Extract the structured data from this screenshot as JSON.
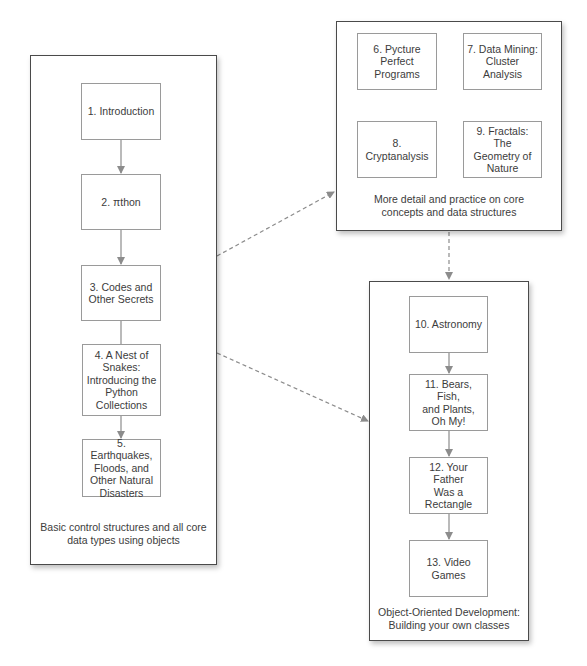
{
  "colors": {
    "group_border": "#4a4a4a",
    "node_border": "#9a9a9a",
    "arrow": "#8c8c8c",
    "text": "#3c3c3c",
    "background": "#ffffff"
  },
  "groups": [
    {
      "id": "basics",
      "caption": "Basic control structures and all core\ndata types using objects",
      "nodes": [
        {
          "id": "ch1",
          "label": "1. Introduction"
        },
        {
          "id": "ch2",
          "label": "2. πthon"
        },
        {
          "id": "ch3",
          "label": "3. Codes and\nOther Secrets"
        },
        {
          "id": "ch4",
          "label": "4. A Nest of\nSnakes:\nIntroducing the\nPython\nCollections"
        },
        {
          "id": "ch5",
          "label": "5. Earthquakes,\nFloods, and\nOther Natural\nDisasters"
        }
      ]
    },
    {
      "id": "practice",
      "caption": "More detail and practice on core\nconcepts and data structures",
      "nodes": [
        {
          "id": "ch6",
          "label": "6. Pycture\nPerfect\nPrograms"
        },
        {
          "id": "ch7",
          "label": "7. Data Mining:\nCluster Analysis"
        },
        {
          "id": "ch8",
          "label": "8.\nCryptanalysis"
        },
        {
          "id": "ch9",
          "label": "9. Fractals: The\nGeometry of\nNature"
        }
      ]
    },
    {
      "id": "oop",
      "caption": "Object-Oriented Development:\nBuilding your own classes",
      "nodes": [
        {
          "id": "ch10",
          "label": "10. Astronomy"
        },
        {
          "id": "ch11",
          "label": "11. Bears, Fish,\nand Plants,\nOh My!"
        },
        {
          "id": "ch12",
          "label": "12. Your Father\nWas a\nRectangle"
        },
        {
          "id": "ch13",
          "label": "13. Video\nGames"
        }
      ]
    }
  ],
  "edges": [
    {
      "from": "ch1",
      "to": "ch2",
      "style": "solid"
    },
    {
      "from": "ch2",
      "to": "ch3",
      "style": "solid"
    },
    {
      "from": "ch3",
      "to": "ch4",
      "style": "solid"
    },
    {
      "from": "ch4",
      "to": "ch5",
      "style": "solid"
    },
    {
      "from": "ch10",
      "to": "ch11",
      "style": "solid"
    },
    {
      "from": "ch11",
      "to": "ch12",
      "style": "solid"
    },
    {
      "from": "ch12",
      "to": "ch13",
      "style": "solid"
    },
    {
      "from": "basics",
      "to": "practice",
      "style": "dashed"
    },
    {
      "from": "basics",
      "to": "oop",
      "style": "dashed"
    },
    {
      "from": "practice",
      "to": "oop",
      "style": "dashed"
    }
  ]
}
